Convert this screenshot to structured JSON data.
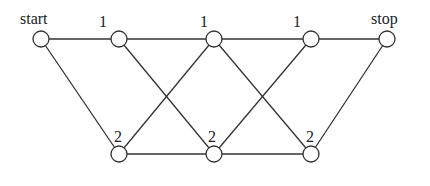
{
  "diagram": {
    "type": "layered-graph",
    "node_radius": 8,
    "colors": {
      "stroke": "#333333",
      "fill": "#ffffff",
      "text": "#222222"
    },
    "nodes": [
      {
        "id": "start",
        "label": "start",
        "x": 41,
        "y": 39,
        "label_x": 20,
        "label_y": 24
      },
      {
        "id": "t1",
        "label": "1",
        "x": 119,
        "y": 39,
        "label_x": 99,
        "label_y": 27
      },
      {
        "id": "t2",
        "label": "1",
        "x": 214,
        "y": 39,
        "label_x": 200,
        "label_y": 27
      },
      {
        "id": "t3",
        "label": "1",
        "x": 311,
        "y": 39,
        "label_x": 293,
        "label_y": 27
      },
      {
        "id": "stop",
        "label": "stop",
        "x": 387,
        "y": 39,
        "label_x": 371,
        "label_y": 24
      },
      {
        "id": "b1",
        "label": "2",
        "x": 119,
        "y": 154,
        "label_x": 114,
        "label_y": 142
      },
      {
        "id": "b2",
        "label": "2",
        "x": 214,
        "y": 154,
        "label_x": 208,
        "label_y": 142
      },
      {
        "id": "b3",
        "label": "2",
        "x": 311,
        "y": 154,
        "label_x": 306,
        "label_y": 142
      }
    ],
    "edges": [
      [
        "start",
        "t1"
      ],
      [
        "t1",
        "t2"
      ],
      [
        "t2",
        "t3"
      ],
      [
        "t3",
        "stop"
      ],
      [
        "b1",
        "b2"
      ],
      [
        "b2",
        "b3"
      ],
      [
        "start",
        "b1"
      ],
      [
        "t1",
        "b2"
      ],
      [
        "b1",
        "t2"
      ],
      [
        "t2",
        "b3"
      ],
      [
        "b2",
        "t3"
      ],
      [
        "b3",
        "stop"
      ]
    ]
  }
}
